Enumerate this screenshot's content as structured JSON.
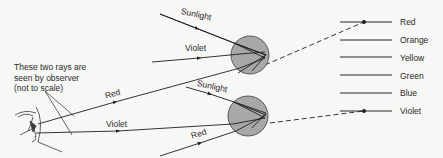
{
  "diagram": {
    "annotation": {
      "line1": "These two rays are",
      "line2": "seen by observer",
      "line3": "(not to scale)"
    },
    "top_drop": {
      "incoming_label": "Sunlight",
      "exiting_label": "Violet"
    },
    "bottom_drop": {
      "incoming_label": "Sunlight",
      "exiting_label": "Red"
    },
    "observer_rays": {
      "upper": "Red",
      "lower": "Violet"
    },
    "spectrum": [
      {
        "label": "Red"
      },
      {
        "label": "Orange"
      },
      {
        "label": "Yellow"
      },
      {
        "label": "Green"
      },
      {
        "label": "Blue"
      },
      {
        "label": "Violet"
      }
    ],
    "colors": {
      "drop_fill": "#a8a8a8",
      "line": "#1e1e1e",
      "spectrum_bar": "#8e8e8e",
      "background": "#f7f7f5"
    }
  }
}
